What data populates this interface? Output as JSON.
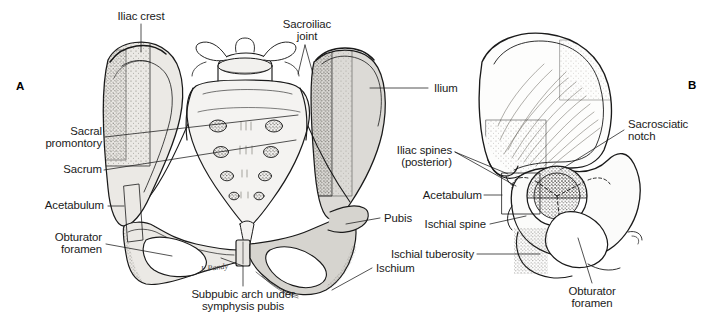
{
  "figure": {
    "background": "#ffffff",
    "ink": "#1a1a1a",
    "bone_fill": "#dcdad6",
    "bone_fill_light": "#ebe9e5",
    "stipple": "#5a5650",
    "artist_signature": "J. Pandy"
  },
  "panels": [
    {
      "id": "A",
      "label": "A",
      "view": "anterior view of bony pelvis"
    },
    {
      "id": "B",
      "label": "B",
      "view": "lateral view of innominate bone"
    }
  ],
  "labels_panel_a": [
    {
      "name": "iliac-crest",
      "text": "Iliac crest"
    },
    {
      "name": "sacroiliac-joint",
      "text": "Sacroiliac\njoint"
    },
    {
      "name": "ilium",
      "text": "Ilium"
    },
    {
      "name": "sacral-promontory",
      "text": "Sacral\npromontory"
    },
    {
      "name": "sacrum",
      "text": "Sacrum"
    },
    {
      "name": "acetabulum",
      "text": "Acetabulum"
    },
    {
      "name": "obturator-foramen",
      "text": "Obturator\nforamen"
    },
    {
      "name": "pubis",
      "text": "Pubis"
    },
    {
      "name": "ischium",
      "text": "Ischium"
    },
    {
      "name": "subpubic-arch",
      "text": "Subpubic arch under\nsymphysis pubis"
    }
  ],
  "labels_panel_b": [
    {
      "name": "sacrosciatic-notch",
      "text": "Sacrosciatic\nnotch"
    },
    {
      "name": "iliac-spines",
      "text": "Iliac spines\n(posterior)"
    },
    {
      "name": "acetabulum-b",
      "text": "Acetabulum"
    },
    {
      "name": "ischial-spine",
      "text": "Ischial spine"
    },
    {
      "name": "ischial-tuberosity",
      "text": "Ischial tuberosity"
    },
    {
      "name": "obturator-foramen-b",
      "text": "Obturator\nforamen"
    }
  ]
}
